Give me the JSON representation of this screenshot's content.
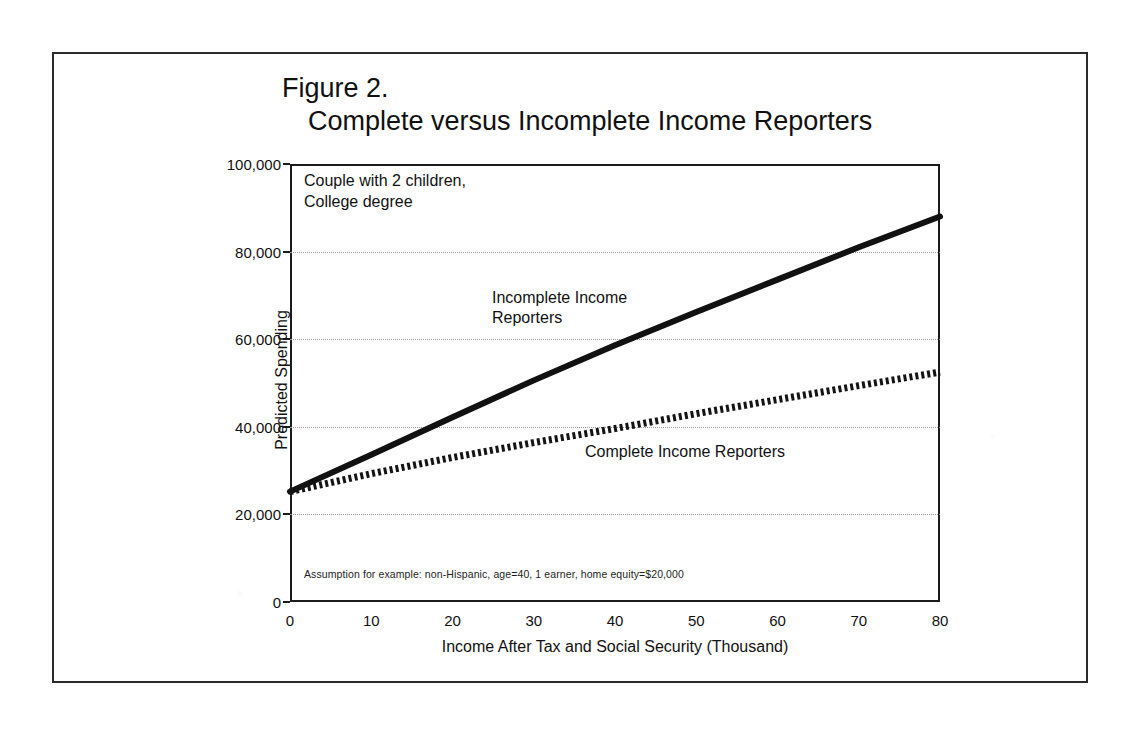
{
  "figure": {
    "title_line_1": "Figure 2.",
    "title_line_2": "Complete versus Incomplete Income Reporters"
  },
  "annotations": {
    "scenario": "Couple with 2 children,\nCollege degree",
    "footnote": "Assumption for example: non-Hispanic, age=40, 1 earner, home equity=$20,000",
    "label_incomplete": "Incomplete Income\nReporters",
    "label_complete": "Complete Income Reporters"
  },
  "colors": {
    "ink": "#1a1a1a",
    "axis": "#1c1c1c",
    "grid": "#9a9a9a",
    "series_incomplete": "#111111",
    "series_complete": "#141414",
    "page": "#ffffff"
  },
  "chart_data": {
    "type": "line",
    "title": "Figure 2. Complete versus Incomplete Income Reporters",
    "xlabel": "Income After Tax and Social Security (Thousand)",
    "ylabel": "Predicted Spending",
    "xlim": [
      0,
      80
    ],
    "ylim": [
      0,
      100000
    ],
    "xticks": [
      0,
      10,
      20,
      30,
      40,
      50,
      60,
      70,
      80
    ],
    "xtick_labels": [
      "0",
      "10",
      "20",
      "30",
      "40",
      "50",
      "60",
      "70",
      "80"
    ],
    "yticks": [
      0,
      20000,
      40000,
      60000,
      80000,
      100000
    ],
    "ytick_labels": [
      "0",
      "20,000",
      "40,000",
      "60,000",
      "80,000",
      "100,000"
    ],
    "grid": true,
    "grid_axis": "y",
    "legend": "inline-labels",
    "x": [
      0,
      10,
      20,
      30,
      40,
      50,
      60,
      70,
      80
    ],
    "series": [
      {
        "name": "Incomplete Income Reporters",
        "style": "solid-thick",
        "values": [
          25200,
          33600,
          42200,
          50600,
          58600,
          66200,
          73600,
          81000,
          88000
        ]
      },
      {
        "name": "Complete Income Reporters",
        "style": "dashed-thick",
        "values": [
          25200,
          29300,
          33000,
          36400,
          39600,
          43000,
          46200,
          49400,
          52500
        ]
      }
    ]
  }
}
